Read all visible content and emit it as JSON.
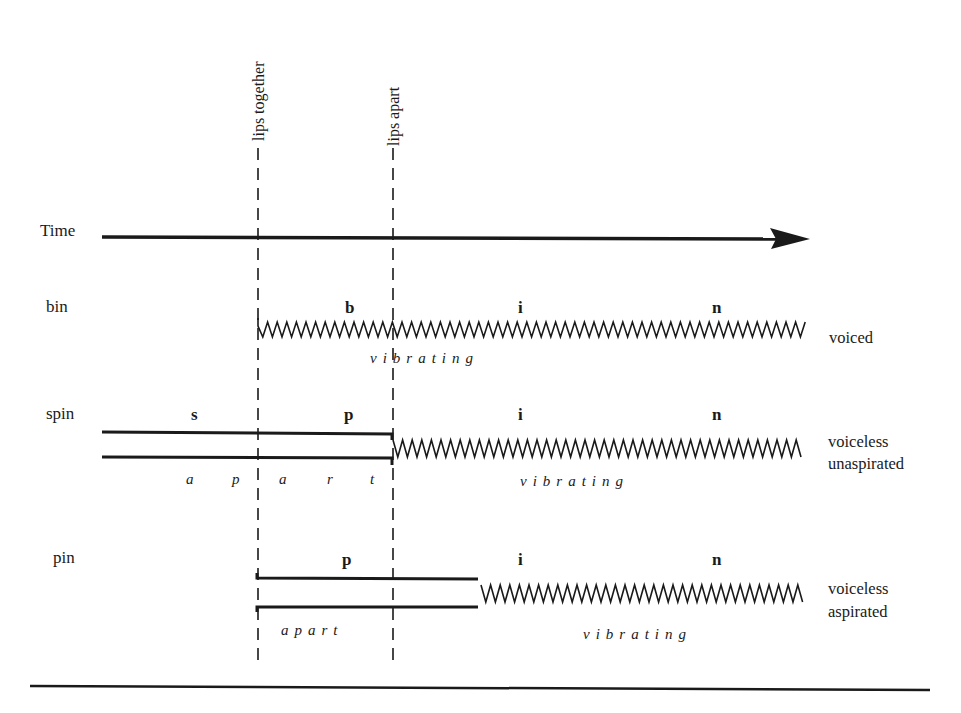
{
  "markers": {
    "lips_together": "lips together",
    "lips_apart": "lips apart"
  },
  "time_axis": {
    "label": "Time"
  },
  "rows": [
    {
      "word": "bin",
      "segments": [
        "b",
        "i",
        "n"
      ],
      "state_labels": [
        "vibrating"
      ],
      "description": "voiced"
    },
    {
      "word": "spin",
      "segments": [
        "s",
        "p",
        "i",
        "n"
      ],
      "state_labels": [
        "a",
        "p",
        "a",
        "r",
        "t",
        "vibrating"
      ],
      "description_line1": "voiceless",
      "description_line2": "unaspirated"
    },
    {
      "word": "pin",
      "segments": [
        "p",
        "i",
        "n"
      ],
      "state_labels": [
        "apart",
        "vibrating"
      ],
      "description_line1": "voiceless",
      "description_line2": "aspirated"
    }
  ],
  "colors": {
    "ink": "#1a1a1a",
    "background": "#ffffff"
  }
}
